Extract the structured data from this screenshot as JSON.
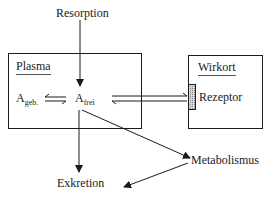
{
  "diagram": {
    "labels": {
      "resorption": "Resorption",
      "plasma": "Plasma",
      "a_bound_main": "A",
      "a_bound_sub": "geb.",
      "a_free_main": "A",
      "a_free_sub": "frei",
      "wirkort": "Wirkort",
      "rezeptor": "Rezeptor",
      "metabolismus": "Metabolismus",
      "exkretion": "Exkretion"
    },
    "nodes": [
      {
        "id": "resorption",
        "label": "Resorption"
      },
      {
        "id": "plasma",
        "label": "Plasma",
        "type": "box",
        "contains": [
          "A_geb.",
          "A_frei"
        ]
      },
      {
        "id": "wirkort",
        "label": "Wirkort",
        "type": "box",
        "contains": [
          "Rezeptor"
        ]
      },
      {
        "id": "metabolismus",
        "label": "Metabolismus"
      },
      {
        "id": "exkretion",
        "label": "Exkretion"
      }
    ],
    "edges": [
      {
        "from": "Resorption",
        "to": "A_frei"
      },
      {
        "from": "A_geb.",
        "to": "A_frei",
        "type": "equilibrium"
      },
      {
        "from": "A_frei",
        "to": "Rezeptor",
        "type": "equilibrium"
      },
      {
        "from": "A_frei",
        "to": "Exkretion"
      },
      {
        "from": "A_frei",
        "to": "Metabolismus"
      },
      {
        "from": "Metabolismus",
        "to": "Exkretion"
      }
    ],
    "colors": {
      "line": "#1a1a1a",
      "receptor_fill": "#b0b0b0"
    }
  }
}
